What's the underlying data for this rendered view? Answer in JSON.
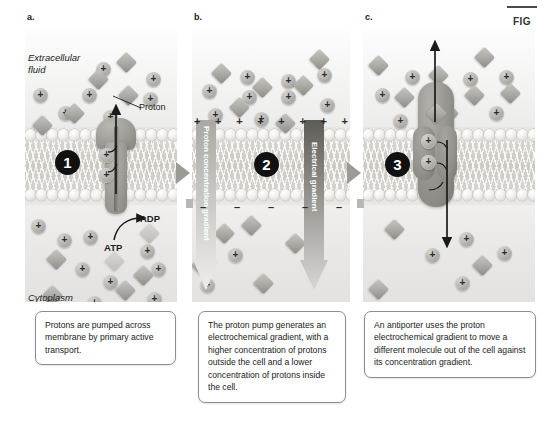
{
  "figure": {
    "marker_label": "FIG",
    "panel_letters": [
      "a.",
      "b.",
      "c."
    ]
  },
  "labels": {
    "extracellular_fluid": "Extracellular fluid",
    "cytoplasm": "Cytoplasm",
    "proton": "Proton",
    "atp": "ATP",
    "adp": "ADP",
    "proton_concentration_gradient": "Proton concentration gradient",
    "electrical_gradient": "Electrical gradient"
  },
  "steps": {
    "step_1": "1",
    "step_2": "2",
    "step_3": "3"
  },
  "captions": {
    "panel_a": "Protons are pumped across membrane by primary active transport.",
    "panel_b": "The proton pump generates an electrochemical gradient, with a higher concentration of protons outside the cell and a lower concentration of protons inside the cell.",
    "panel_c": "An antiporter uses the proton electrochemical gradient to move a different molecule out of the cell against its concentration gradient."
  },
  "charges": {
    "plus_symbol": "+",
    "minus_symbol": "–",
    "outer_plus_count": 8,
    "inner_minus_count": 5
  },
  "colors": {
    "membrane_head": "#f2f1ef",
    "membrane_core": "#d2cfc9",
    "protein_gray": "#9a9893",
    "badge_black": "#111111",
    "gradient_bar_light": "#b9b7b2",
    "gradient_bar_dark": "#6f6d68",
    "caption_border": "#8e8c88",
    "extracellular_bg": "#f5f4f3",
    "cytoplasm_bg": "#e8e7e5"
  },
  "chart_data": {
    "type": "diagram",
    "panels": [
      {
        "letter": "a.",
        "step": "1",
        "mechanism": "primary active transport",
        "transporter": "proton pump",
        "energy_source": "ATP hydrolysis to ADP",
        "proton_direction": "cytoplasm to extracellular fluid",
        "extracellular_protons": 9,
        "extracellular_molecules": 5,
        "cytoplasm_protons": 8,
        "cytoplasm_molecules": 5,
        "protons_in_channel": 2
      },
      {
        "letter": "b.",
        "step": "2",
        "mechanism": "electrochemical gradient established",
        "gradients": [
          "Proton concentration gradient",
          "Electrical gradient"
        ],
        "outer_membrane_charge": "+",
        "inner_membrane_charge": "–",
        "extracellular_protons": 8,
        "extracellular_molecules": 6,
        "cytoplasm_protons": 2,
        "cytoplasm_molecules": 5
      },
      {
        "letter": "c.",
        "step": "3",
        "mechanism": "secondary active transport",
        "transporter": "antiporter",
        "proton_direction": "extracellular fluid to cytoplasm",
        "molecule_direction": "cytoplasm to extracellular fluid",
        "extracellular_protons": 7,
        "extracellular_molecules": 7,
        "cytoplasm_protons": 4,
        "cytoplasm_molecules": 3,
        "protons_in_porter": 2
      }
    ]
  },
  "particles": {
    "panel_a_extra_protons": [
      [
        71,
        32
      ],
      [
        121,
        42
      ],
      [
        8,
        58
      ],
      [
        57,
        58
      ],
      [
        118,
        62
      ],
      [
        33,
        76
      ],
      [
        78,
        80
      ]
    ],
    "panel_a_extra_molecules": [
      [
        94,
        25
      ],
      [
        66,
        42
      ],
      [
        96,
        58
      ],
      [
        42,
        76
      ],
      [
        10,
        88
      ]
    ],
    "panel_a_cyto_protons": [
      [
        6,
        189
      ],
      [
        32,
        203
      ],
      [
        58,
        200
      ],
      [
        115,
        214
      ],
      [
        126,
        232
      ],
      [
        50,
        232
      ],
      [
        78,
        245
      ],
      [
        62,
        266
      ],
      [
        122,
        262
      ]
    ],
    "panel_a_cyto_molecules": [
      [
        24,
        222
      ],
      [
        93,
        253
      ],
      [
        111,
        238
      ],
      [
        62,
        286
      ],
      [
        20,
        258
      ]
    ],
    "panel_b_extra_protons": [
      [
        48,
        40
      ],
      [
        89,
        44
      ],
      [
        125,
        38
      ],
      [
        10,
        54
      ],
      [
        50,
        60
      ],
      [
        89,
        60
      ],
      [
        128,
        68
      ],
      [
        16,
        78
      ],
      [
        62,
        82
      ]
    ],
    "panel_b_extra_molecules": [
      [
        22,
        36
      ],
      [
        63,
        50
      ],
      [
        104,
        48
      ],
      [
        40,
        70
      ],
      [
        86,
        86
      ],
      [
        120,
        22
      ]
    ],
    "panel_b_cyto_protons": [
      [
        36,
        218
      ],
      [
        8,
        248
      ]
    ],
    "panel_b_cyto_molecules": [
      [
        2,
        228
      ],
      [
        25,
        196
      ],
      [
        52,
        188
      ],
      [
        64,
        246
      ],
      [
        96,
        206
      ]
    ],
    "panel_c_extra_protons": [
      [
        42,
        40
      ],
      [
        100,
        42
      ],
      [
        136,
        40
      ],
      [
        12,
        58
      ],
      [
        66,
        58
      ],
      [
        126,
        76
      ],
      [
        30,
        84
      ]
    ],
    "panel_c_extra_molecules": [
      [
        68,
        38
      ],
      [
        34,
        60
      ],
      [
        104,
        58
      ],
      [
        140,
        56
      ],
      [
        78,
        76
      ],
      [
        8,
        28
      ],
      [
        114,
        20
      ]
    ],
    "panel_c_cyto_protons": [
      [
        96,
        202
      ],
      [
        62,
        218
      ],
      [
        134,
        216
      ],
      [
        92,
        246
      ]
    ],
    "panel_c_cyto_molecules": [
      [
        24,
        192
      ],
      [
        112,
        228
      ],
      [
        8,
        252
      ]
    ]
  }
}
